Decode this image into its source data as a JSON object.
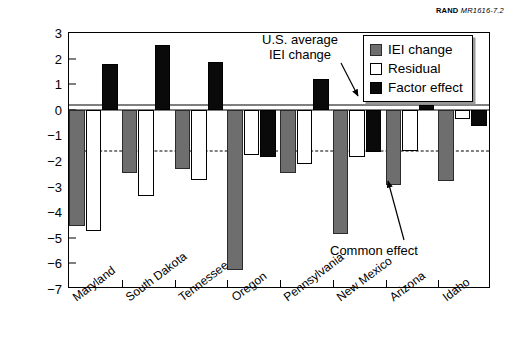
{
  "source_tag": {
    "org": "RAND",
    "doc_id": "MR1616-7.2"
  },
  "chart_data": {
    "type": "bar",
    "title": "",
    "subtitle": "",
    "xlabel": "",
    "ylabel": "Annual percent change",
    "ylim": [
      -7,
      3
    ],
    "yticks": [
      3,
      2,
      1,
      0,
      -1,
      -2,
      -3,
      -4,
      -5,
      -6,
      -7
    ],
    "ytick_labels": [
      "3",
      "2",
      "1",
      "0",
      "−1",
      "−2",
      "−3",
      "−4",
      "−5",
      "−6",
      "−7"
    ],
    "grid": false,
    "legend_position": "top-right",
    "categories": [
      "Maryland",
      "South Dakota",
      "Tennessee",
      "Oregon",
      "Pennsylvania",
      "New Mexico",
      "Arizona",
      "Idaho"
    ],
    "series": [
      {
        "name": "IEI change",
        "color": "#6e6e6e",
        "values": [
          -4.55,
          -2.45,
          -2.3,
          -6.25,
          -2.45,
          -4.85,
          -2.95,
          -2.8
        ]
      },
      {
        "name": "Residual",
        "color": "#ffffff",
        "values": [
          -4.75,
          -3.35,
          -2.75,
          -1.75,
          -2.1,
          -1.85,
          -1.6,
          -0.35
        ]
      },
      {
        "name": "Factor effect",
        "color": "#0a0a0a",
        "values": [
          1.77,
          2.52,
          1.85,
          -1.85,
          1.2,
          -1.65,
          0.2,
          -0.65
        ]
      }
    ],
    "reference_lines": [
      {
        "name": "us-average-iei-change",
        "label": "U.S. average\nIEI change",
        "value": 0.2,
        "style": "solid"
      },
      {
        "name": "common-effect",
        "label": "Common effect",
        "value": -1.6,
        "style": "dashed"
      }
    ],
    "annotations": [
      {
        "name": "us-average-annotation",
        "line1": "U.S. average",
        "line2": "IEI change"
      },
      {
        "name": "common-effect-annotation",
        "line1": "Common effect"
      }
    ]
  },
  "legend": {
    "items": [
      {
        "label": "IEI change",
        "swatch": "gray-swatch"
      },
      {
        "label": "Residual",
        "swatch": "white-swatch"
      },
      {
        "label": "Factor effect",
        "swatch": "black-swatch"
      }
    ]
  }
}
